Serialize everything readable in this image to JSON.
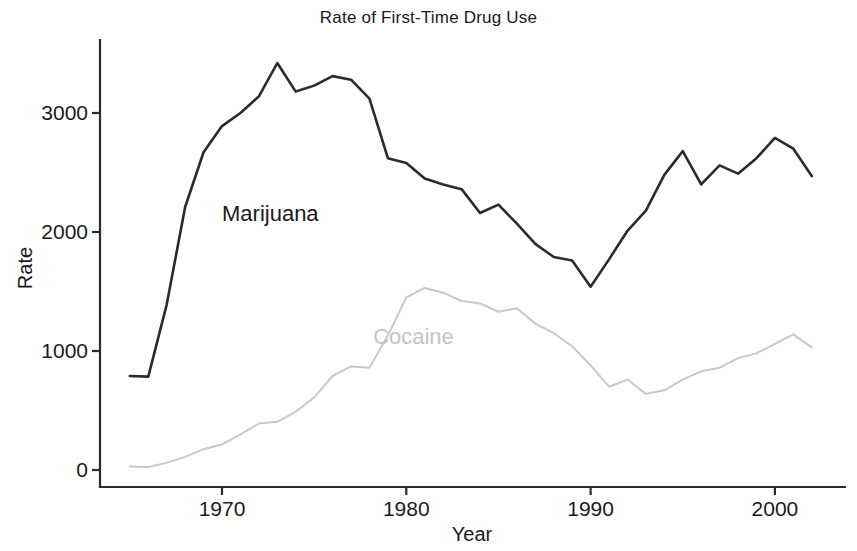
{
  "chart_data": {
    "type": "line",
    "title": "Rate of First-Time Drug Use",
    "xlabel": "Year",
    "ylabel": "Rate",
    "xlim": [
      1965,
      2002
    ],
    "ylim": [
      0,
      3550
    ],
    "grid": false,
    "legend": "inline-labels",
    "xticks": [
      1970,
      1980,
      1990,
      2000
    ],
    "xtick_labels": [
      "1970",
      "1980",
      "1990",
      "2000"
    ],
    "yticks": [
      0,
      1000,
      2000,
      3000
    ],
    "ytick_labels": [
      "0",
      "1000",
      "2000",
      "3000"
    ],
    "x": [
      1965,
      1966,
      1967,
      1968,
      1969,
      1970,
      1971,
      1972,
      1973,
      1974,
      1975,
      1976,
      1977,
      1978,
      1979,
      1980,
      1981,
      1982,
      1983,
      1984,
      1985,
      1986,
      1987,
      1988,
      1989,
      1990,
      1991,
      1992,
      1993,
      1994,
      1995,
      1996,
      1997,
      1998,
      1999,
      2000,
      2001,
      2002
    ],
    "series": [
      {
        "name": "Marijuana",
        "color": "#2b2b2b",
        "label_position": {
          "x": 1970.0,
          "y": 2090
        },
        "values": [
          790,
          785,
          1390,
          2210,
          2670,
          2890,
          3000,
          3140,
          3420,
          3180,
          3230,
          3310,
          3280,
          3120,
          2620,
          2580,
          2450,
          2400,
          2360,
          2160,
          2230,
          2070,
          1900,
          1790,
          1760,
          1540,
          1770,
          2010,
          2180,
          2480,
          2680,
          2400,
          2560,
          2490,
          2620,
          2790,
          2700,
          2470
        ]
      },
      {
        "name": "Cocaine",
        "color": "#c9c9c9",
        "label_position": {
          "x": 1978.2,
          "y": 1060
        },
        "values": [
          30,
          25,
          60,
          110,
          175,
          215,
          300,
          390,
          405,
          490,
          610,
          790,
          870,
          860,
          1130,
          1450,
          1530,
          1490,
          1420,
          1400,
          1330,
          1360,
          1230,
          1150,
          1040,
          880,
          700,
          760,
          640,
          670,
          760,
          830,
          860,
          940,
          980,
          1060,
          1140,
          1030
        ]
      }
    ]
  },
  "axes": {
    "y_axis_name": "y-axis",
    "x_axis_name": "x-axis"
  }
}
